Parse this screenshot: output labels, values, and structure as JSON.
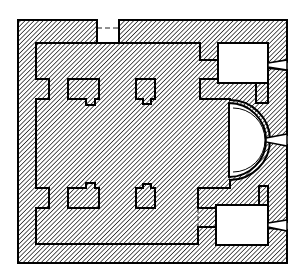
{
  "diagram": {
    "type": "architectural-floor-plan",
    "colors": {
      "ink": "#000000",
      "background": "#ffffff",
      "hatch": "#000000"
    },
    "elements": {
      "outer_wall": "hatched perimeter wall",
      "piers": [
        "north-west pier",
        "north-east pier",
        "south-west pier",
        "south-east pier"
      ],
      "apse": "semicircular apse on east side",
      "side_chambers": [
        "north chamber (prothesis)",
        "south chamber (diaconicon)"
      ],
      "openings": [
        "north door",
        "south door",
        "east windows"
      ]
    }
  }
}
